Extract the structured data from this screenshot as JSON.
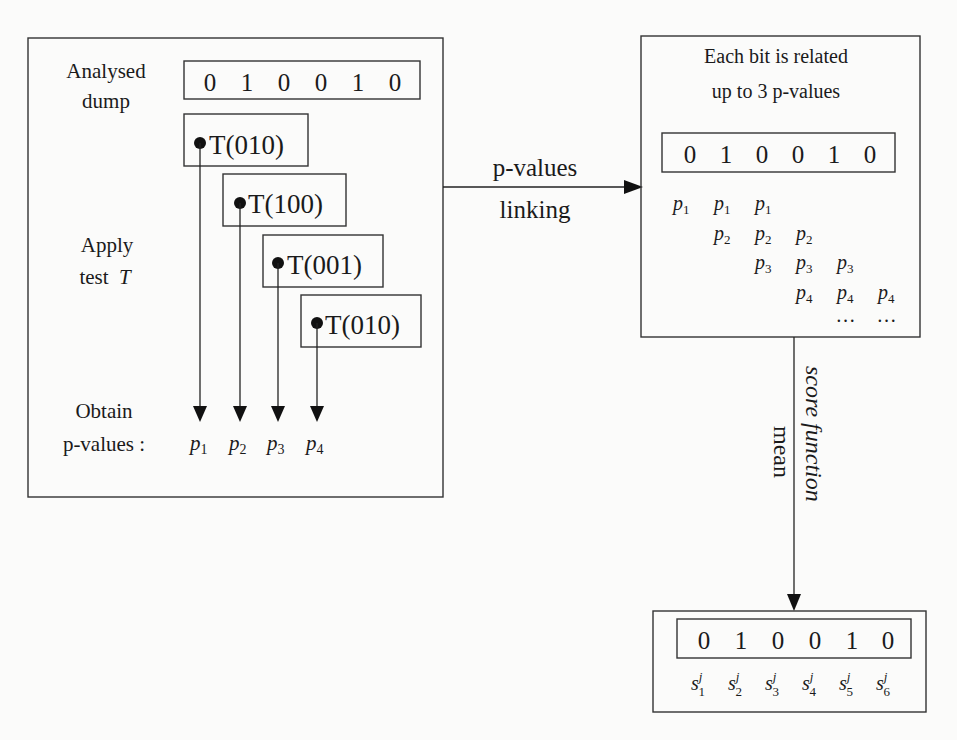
{
  "diagram": {
    "type": "flow",
    "analysis_box": {
      "label_dump_line1": "Analysed",
      "label_dump_line2": "dump",
      "bits": [
        "0",
        "1",
        "0",
        "0",
        "1",
        "0"
      ],
      "label_apply_line1": "Apply",
      "label_apply_line2": "test",
      "label_apply_var": "T",
      "tests": [
        {
          "label": "T(010)"
        },
        {
          "label": "T(100)"
        },
        {
          "label": "T(001)"
        },
        {
          "label": "T(010)"
        }
      ],
      "label_obtain_line1": "Obtain",
      "label_obtain_line2": "p-values :",
      "pvalues": [
        {
          "base": "p",
          "sub": "1"
        },
        {
          "base": "p",
          "sub": "2"
        },
        {
          "base": "p",
          "sub": "3"
        },
        {
          "base": "p",
          "sub": "4"
        }
      ]
    },
    "link_arrow": {
      "label_line1": "p-values",
      "label_line2": "linking"
    },
    "linking_box": {
      "title_line1": "Each bit is related",
      "title_line2": "up to 3 p-values",
      "bits": [
        "0",
        "1",
        "0",
        "0",
        "1",
        "0"
      ],
      "grid": [
        [
          "p1",
          "p1",
          "p1",
          "",
          "",
          ""
        ],
        [
          "",
          "p2",
          "p2",
          "p2",
          "",
          ""
        ],
        [
          "",
          "",
          "p3",
          "p3",
          "p3",
          ""
        ],
        [
          "",
          "",
          "",
          "p4",
          "p4",
          "p4"
        ],
        [
          "",
          "",
          "",
          "",
          "…",
          "…"
        ]
      ]
    },
    "score_arrow": {
      "label_italic": "score function",
      "label_plain": "mean"
    },
    "score_box": {
      "bits": [
        "0",
        "1",
        "0",
        "0",
        "1",
        "0"
      ],
      "scores": [
        {
          "base": "s",
          "sup": "j",
          "sub": "1"
        },
        {
          "base": "s",
          "sup": "j",
          "sub": "2"
        },
        {
          "base": "s",
          "sup": "j",
          "sub": "3"
        },
        {
          "base": "s",
          "sup": "j",
          "sub": "4"
        },
        {
          "base": "s",
          "sup": "j",
          "sub": "5"
        },
        {
          "base": "s",
          "sup": "j",
          "sub": "6"
        }
      ]
    }
  }
}
